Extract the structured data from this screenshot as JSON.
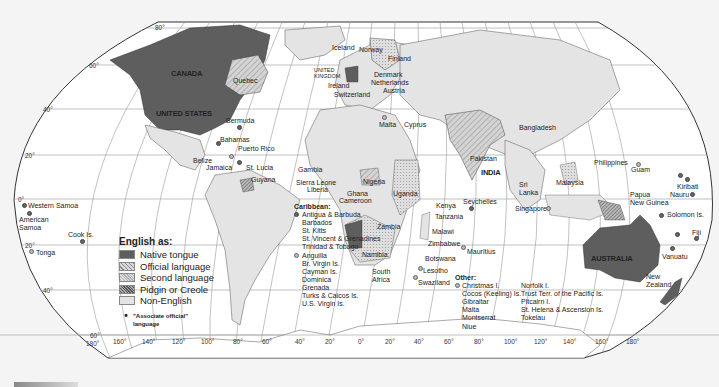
{
  "map": {
    "title": "English as:",
    "legend": {
      "title": "English as:",
      "items": [
        {
          "label": "Native tongue",
          "fill": "#5e5e5e",
          "pattern": "solid"
        },
        {
          "label": "Official language",
          "fill": "#c8c8c8",
          "pattern": "diagonal-light"
        },
        {
          "label": "Second language",
          "fill": "#d8d8d8",
          "pattern": "fine-dots"
        },
        {
          "label": "Pidgin or Creole",
          "fill": "#9a9a9a",
          "pattern": "dense-diagonal"
        },
        {
          "label": "Non-English",
          "fill": "#e4e4e4",
          "pattern": "solid"
        }
      ],
      "associate_symbol": "•",
      "associate_label_line1": "\"Associate official\"",
      "associate_label_line2": "language"
    },
    "latitude_labels": {
      "n80": "80°",
      "n60": "60°",
      "n40": "40°",
      "n20": "20°",
      "eq": "0°",
      "s20": "20°",
      "s40": "40°",
      "s60": "60°"
    },
    "longitude_labels": [
      "180°",
      "160°",
      "140°",
      "120°",
      "100°",
      "80°",
      "60°",
      "40°",
      "20°",
      "0°",
      "20°",
      "40°",
      "60°",
      "80°",
      "100°",
      "120°",
      "140°",
      "160°",
      "180°"
    ],
    "country_labels": {
      "canada": "CANADA",
      "united_states": "UNITED STATES",
      "quebec": "Quebec",
      "bermuda": "Bermuda",
      "bahamas": "Bahamas",
      "puerto_rico": "Puerto Rico",
      "belize": "Belize",
      "jamaica": "Jamaica",
      "st_lucia": "St. Lucia",
      "guyana": "Guyana",
      "iceland": "Iceland",
      "uk_line1": "UNITED",
      "uk_line2": "KINGDOM",
      "ireland": "Ireland",
      "switzerland": "Switzerland",
      "norway": "Norway",
      "sweden": "Sweden",
      "finland": "Finland",
      "denmark": "Denmark",
      "netherlands": "Netherlands",
      "austria": "Austria",
      "malta": "Malta",
      "cyprus": "Cyprus",
      "gambia": "Gambia",
      "sierra_leone": "Sierra Leone",
      "liberia": "Liberia",
      "ghana": "Ghana",
      "nigeria": "Nigeria",
      "cameroon": "Cameroon",
      "uganda": "Uganda",
      "kenya": "Kenya",
      "tanzania": "Tanzania",
      "seychelles": "Seychelles",
      "zambia": "Zambia",
      "malawi": "Malawi",
      "zimbabwe": "Zimbabwe",
      "mauritius": "Mauritius",
      "namibia": "Namibia",
      "botswana": "Botswana",
      "south_africa_line1": "South",
      "south_africa_line2": "Africa",
      "lesotho": "Lesotho",
      "swaziland": "Swaziland",
      "pakistan": "Pakistan",
      "india": "INDIA",
      "bangladesh": "Bangladesh",
      "sri_lanka_line1": "Sri",
      "sri_lanka_line2": "Lanka",
      "malaysia": "Malaysia",
      "singapore": "Singapore",
      "philippines": "Philippines",
      "guam": "Guam",
      "kiribati": "Kiribati",
      "nauru": "Nauru",
      "png_line1": "Papua",
      "png_line2": "New Guinea",
      "solomon": "Solomon Is.",
      "fiji": "Fiji",
      "vanuatu": "Vanuatu",
      "australia": "AUSTRALIA",
      "new_zealand_line1": "New",
      "new_zealand_line2": "Zealand",
      "western_samoa": "Western Samoa",
      "american_samoa_line1": "American",
      "american_samoa_line2": "Samoa",
      "cook": "Cook Is.",
      "tonga": "Tonga"
    },
    "caribbean": {
      "heading": "Caribbean:",
      "dark_group": [
        "Antigua & Barbuda",
        "Barbados",
        "St. Kitts",
        "St. Vincent & Grenadines",
        "Trinidad & Tobago"
      ],
      "light_group": [
        "Anguilla",
        "Br. Virgin Is.",
        "Cayman Is.",
        "Dominica",
        "Grenada",
        "Turks & Caicos Is.",
        "U.S. Virgin Is."
      ]
    },
    "other": {
      "heading": "Other:",
      "col1": [
        "Christmas I.",
        "Cocos (Keeling) Is.",
        "Gibraltar",
        "Malta",
        "Montserrat",
        "Niue"
      ],
      "col2": [
        "Norfolk I.",
        "Trust Terr. of the Pacific Is.",
        "Pitcairn I.",
        "St. Helena  & Ascension Is.",
        "Tokelau"
      ]
    },
    "colors": {
      "native": "#5e5e5e",
      "official": "#c8c8c8",
      "second": "#d8d8d8",
      "pidgin": "#9a9a9a",
      "non_english": "#e4e4e4",
      "ocean": "#ffffff",
      "background": "#f4f4f4",
      "grid": "#888888"
    }
  }
}
